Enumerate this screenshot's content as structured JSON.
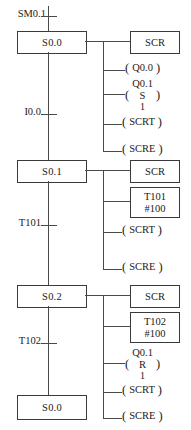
{
  "diagram": {
    "type": "sequential-function-chart",
    "line_color": "#3a3a3a"
  },
  "steps": [
    {
      "name": "S0.0",
      "entry_transition": {
        "label": "SM0.1"
      },
      "exit_transition": {
        "label": "I0.0"
      },
      "actions": [
        {
          "kind": "box",
          "lines": [
            "SCR"
          ]
        },
        {
          "kind": "coil",
          "top": "",
          "mid": "Q0.0",
          "bot": ""
        },
        {
          "kind": "coil",
          "top": "Q0.1",
          "mid": "S",
          "bot": "1"
        },
        {
          "kind": "coil",
          "top": "",
          "mid": "SCRT",
          "bot": ""
        },
        {
          "kind": "coil",
          "top": "",
          "mid": "SCRE",
          "bot": ""
        }
      ]
    },
    {
      "name": "S0.1",
      "exit_transition": {
        "label": "T101"
      },
      "actions": [
        {
          "kind": "box",
          "lines": [
            "SCR"
          ]
        },
        {
          "kind": "box",
          "lines": [
            "T101",
            "#100"
          ]
        },
        {
          "kind": "coil",
          "top": "",
          "mid": "SCRT",
          "bot": ""
        },
        {
          "kind": "coil",
          "top": "",
          "mid": "SCRE",
          "bot": ""
        }
      ]
    },
    {
      "name": "S0.2",
      "exit_transition": {
        "label": "T102"
      },
      "actions": [
        {
          "kind": "box",
          "lines": [
            "SCR"
          ]
        },
        {
          "kind": "box",
          "lines": [
            "T102",
            "#100"
          ]
        },
        {
          "kind": "coil",
          "top": "Q0.1",
          "mid": "R",
          "bot": "1"
        },
        {
          "kind": "coil",
          "top": "",
          "mid": "SCRT",
          "bot": ""
        },
        {
          "kind": "coil",
          "top": "",
          "mid": "SCRE",
          "bot": ""
        }
      ]
    },
    {
      "name": "S0.0",
      "is_return": true,
      "actions": []
    }
  ],
  "labels": {
    "step1": "S0.0",
    "step2": "S0.1",
    "step3": "S0.2",
    "step4": "S0.0",
    "t_sm01": "SM0.1",
    "t_i00": "I0.0",
    "t_t101": "T101",
    "t_t102": "T102",
    "scr": "SCR",
    "timer101_name": "T101",
    "timer101_preset": "#100",
    "timer102_name": "T102",
    "timer102_preset": "#100",
    "coil_q00": "Q0.0",
    "coil_q01": "Q0.1",
    "set_op": "S",
    "reset_op": "R",
    "op_num": "1",
    "scrt": "SCRT",
    "scre": "SCRE",
    "paren_open": "(",
    "paren_close": ")"
  }
}
